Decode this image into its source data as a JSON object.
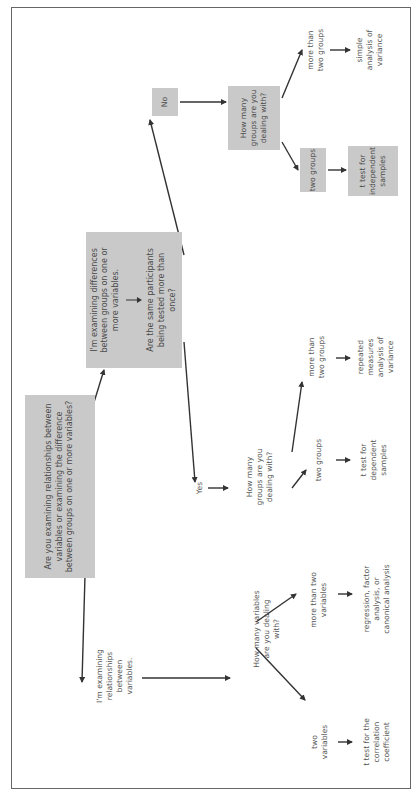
{
  "diagram": {
    "orientation": "rotated-90-ccw",
    "colors": {
      "box_fill": "#c9c9c9",
      "text": "#555555",
      "arrow": "#333333",
      "frame": "#666666"
    },
    "root": {
      "question": "Are you examining relationships between variables or examining the difference between groups on one or more variables?"
    },
    "relationships_branch": {
      "answer": "I'm examining relationships between variables.",
      "question": "How many variables are you dealing with?",
      "options": [
        {
          "label": "two variables",
          "test": "t test for the correlation coefficient"
        },
        {
          "label": "more than two variables",
          "test": "regression, factor analysis, or canonical analysis"
        }
      ]
    },
    "differences_branch": {
      "answer": "I'm examining differences between groups on one or more variables.",
      "question": "Are the same participants being tested more than once?",
      "yes": {
        "label": "Yes",
        "question": "How many groups are you dealing with?",
        "options": [
          {
            "label": "two groups",
            "test": "t test for dependent samples"
          },
          {
            "label": "more than two groups",
            "test": "repeated measures analysis of variance"
          }
        ]
      },
      "no": {
        "label": "No",
        "question": "How many groups are you dealing with?",
        "options": [
          {
            "label": "two groups",
            "test": "t test for independent samples"
          },
          {
            "label": "more than two groups",
            "test": "simple analysis of variance"
          }
        ]
      }
    }
  }
}
